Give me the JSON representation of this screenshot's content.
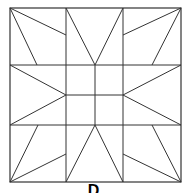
{
  "diagram": {
    "type": "quilt-block",
    "stroke_color": "#333333",
    "background": "#ffffff",
    "outer": {
      "x1": 10,
      "y1": 8,
      "x2": 181,
      "y2": 182
    },
    "lines": [
      [
        66,
        8,
        66,
        182
      ],
      [
        123,
        8,
        123,
        182
      ],
      [
        10,
        65,
        181,
        65
      ],
      [
        10,
        125,
        181,
        125
      ],
      [
        95,
        65,
        95,
        125
      ],
      [
        66,
        95,
        123,
        95
      ],
      [
        10,
        8,
        66,
        35
      ],
      [
        10,
        8,
        37,
        65
      ],
      [
        181,
        8,
        123,
        35
      ],
      [
        181,
        8,
        152,
        65
      ],
      [
        10,
        182,
        38,
        125
      ],
      [
        10,
        182,
        66,
        154
      ],
      [
        181,
        182,
        152,
        125
      ],
      [
        181,
        182,
        123,
        154
      ],
      [
        66,
        8,
        95,
        65
      ],
      [
        123,
        8,
        95,
        65
      ],
      [
        66,
        182,
        95,
        125
      ],
      [
        123,
        182,
        95,
        125
      ],
      [
        10,
        65,
        66,
        95
      ],
      [
        10,
        125,
        66,
        95
      ],
      [
        181,
        65,
        123,
        95
      ],
      [
        181,
        125,
        123,
        95
      ]
    ]
  },
  "caption": {
    "text": "D"
  }
}
